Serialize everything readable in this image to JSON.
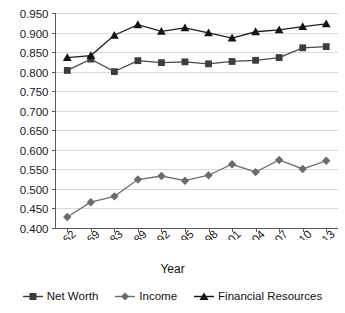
{
  "chart_data": {
    "type": "line",
    "title": "",
    "xlabel": "Year",
    "ylabel": "",
    "categories": [
      "1962",
      "1969",
      "1983",
      "1989",
      "1992",
      "1995",
      "1998",
      "2001",
      "2004",
      "2007",
      "2010",
      "2013"
    ],
    "ylim": [
      0.4,
      0.95
    ],
    "ytick_labels": [
      "0.950",
      "0.900",
      "0.850",
      "0.800",
      "0.750",
      "0.700",
      "0.650",
      "0.600",
      "0.550",
      "0.500",
      "0.450",
      "0.400"
    ],
    "ytick_values": [
      0.95,
      0.9,
      0.85,
      0.8,
      0.75,
      0.7,
      0.65,
      0.6,
      0.55,
      0.5,
      0.45,
      0.4
    ],
    "grid": true,
    "legend_position": "bottom",
    "series": [
      {
        "name": "Net Worth",
        "marker": "square",
        "color": "#3d3d3d",
        "values": [
          0.803,
          0.832,
          0.8,
          0.828,
          0.823,
          0.825,
          0.82,
          0.826,
          0.829,
          0.836,
          0.861,
          0.864
        ]
      },
      {
        "name": "Income",
        "marker": "diamond",
        "color": "#6b6b6b",
        "values": [
          0.428,
          0.466,
          0.481,
          0.524,
          0.533,
          0.521,
          0.535,
          0.563,
          0.543,
          0.574,
          0.551,
          0.572
        ]
      },
      {
        "name": "Financial Resources",
        "marker": "triangle",
        "color": "#141414",
        "values": [
          0.836,
          0.841,
          0.893,
          0.92,
          0.903,
          0.912,
          0.899,
          0.886,
          0.902,
          0.907,
          0.915,
          0.922
        ]
      }
    ]
  },
  "legend": {
    "items": [
      {
        "label": "Net Worth",
        "marker": "square"
      },
      {
        "label": "Income",
        "marker": "diamond"
      },
      {
        "label": "Financial Resources",
        "marker": "triangle"
      }
    ]
  },
  "axis": {
    "x_title": "Year"
  }
}
